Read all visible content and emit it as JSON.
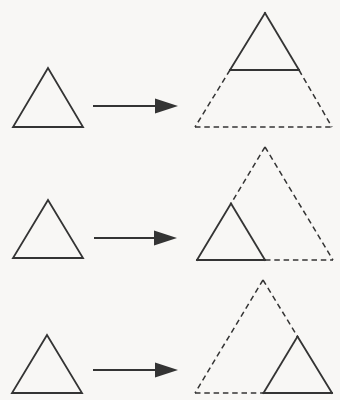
{
  "diagram": {
    "width": 340,
    "height": 400
  },
  "style": {
    "background": "#f8f7f5",
    "stroke_color": "#343434",
    "solid_stroke_width": 1.8,
    "dashed_stroke_width": 1.5,
    "arrow_stroke_width": 2,
    "dash_pattern": "5.5,3.8",
    "arrow_head_length": 23,
    "arrow_head_half_width": 7.5
  },
  "rows": [
    {
      "id": "row-dilation-center-apex",
      "small_triangle": [
        [
          48,
          68
        ],
        [
          13,
          127
        ],
        [
          83,
          127
        ]
      ],
      "arrow": {
        "from": [
          93,
          106
        ],
        "to": [
          178,
          106
        ]
      },
      "result": {
        "solid": [
          [
            [
              265,
              13
            ],
            [
              230,
              70
            ]
          ],
          [
            [
              265,
              13
            ],
            [
              299,
              70
            ]
          ],
          [
            [
              230,
              70
            ],
            [
              299,
              70
            ]
          ]
        ],
        "dashed": [
          [
            [
              230,
              70
            ],
            [
              195,
              127
            ]
          ],
          [
            [
              299,
              70
            ],
            [
              332,
              127
            ]
          ],
          [
            [
              195,
              127
            ],
            [
              332,
              127
            ]
          ]
        ]
      }
    },
    {
      "id": "row-dilation-center-bottom-left",
      "small_triangle": [
        [
          48,
          200
        ],
        [
          13,
          258
        ],
        [
          83,
          258
        ]
      ],
      "arrow": {
        "from": [
          94,
          238
        ],
        "to": [
          177,
          238
        ]
      },
      "result": {
        "solid": [
          [
            [
              231,
              203.5
            ],
            [
              197,
              260
            ]
          ],
          [
            [
              231,
              203.5
            ],
            [
              265,
              260
            ]
          ],
          [
            [
              197,
              260
            ],
            [
              265,
              260
            ]
          ]
        ],
        "dashed": [
          [
            [
              265,
              147
            ],
            [
              231,
              203.5
            ]
          ],
          [
            [
              265,
              147
            ],
            [
              333,
              260
            ]
          ],
          [
            [
              265,
              260
            ],
            [
              333,
              260
            ]
          ]
        ]
      }
    },
    {
      "id": "row-dilation-center-bottom-right",
      "small_triangle": [
        [
          47,
          335
        ],
        [
          12,
          393
        ],
        [
          82,
          393
        ]
      ],
      "arrow": {
        "from": [
          93,
          370
        ],
        "to": [
          178,
          370
        ]
      },
      "result": {
        "solid": [
          [
            [
              297.5,
              336.5
            ],
            [
              332,
              393
            ]
          ],
          [
            [
              297.5,
              336.5
            ],
            [
              263.5,
              393
            ]
          ],
          [
            [
              263.5,
              393
            ],
            [
              332,
              393
            ]
          ]
        ],
        "dashed": [
          [
            [
              263,
              280
            ],
            [
              297.5,
              336.5
            ]
          ],
          [
            [
              263,
              280
            ],
            [
              195,
              393
            ]
          ],
          [
            [
              195,
              393
            ],
            [
              263.5,
              393
            ]
          ]
        ]
      }
    }
  ]
}
